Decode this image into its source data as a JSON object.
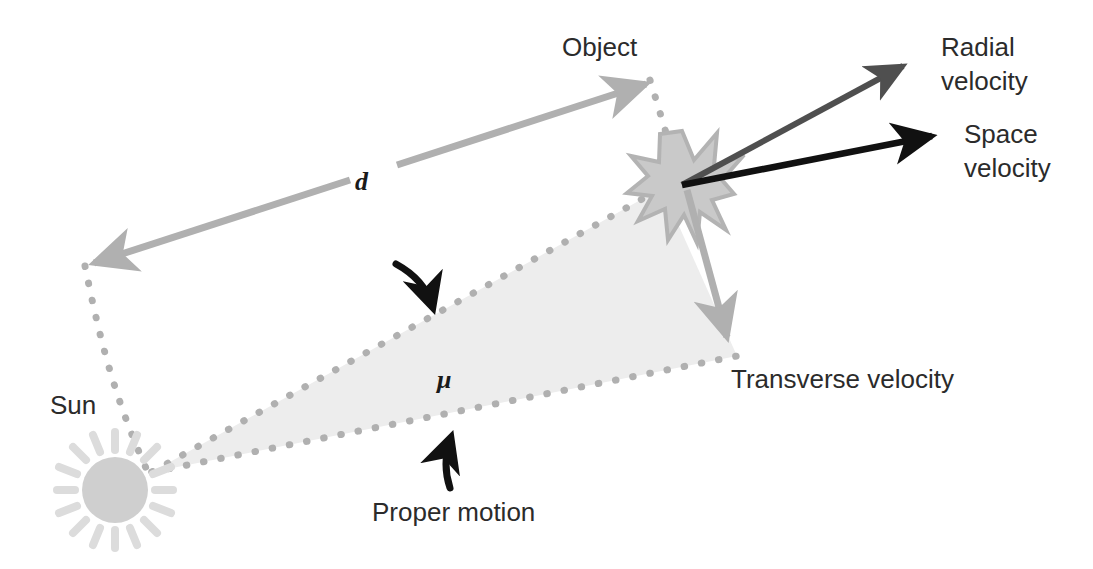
{
  "diagram": {
    "background_color": "#ffffff",
    "width": 1093,
    "height": 569
  },
  "palette": {
    "light_gray": "#bfbfbf",
    "mid_gray": "#a8a8a8",
    "dark_gray": "#555555",
    "black": "#111111",
    "text": "#2b2b2b",
    "fill_gray": "#eaeaea",
    "dot_gray": "#b0b0b0",
    "sun_body": "#cfcfcf",
    "sun_ray": "#dcdcdc",
    "star_fill": "#c9c9c9",
    "star_stroke": "#b3b3b3"
  },
  "labels": {
    "object": "Object",
    "sun": "Sun",
    "distance": "d",
    "mu": "μ",
    "radial_velocity_line1": "Radial",
    "radial_velocity_line2": "velocity",
    "space_velocity_line1": "Space",
    "space_velocity_line2": "velocity",
    "transverse_velocity": "Transverse velocity",
    "proper_motion": "Proper motion"
  },
  "elements": {
    "sun": {
      "cx": 115,
      "cy": 490,
      "r": 33,
      "ray_count": 16,
      "ray_inner": 40,
      "ray_outer": 58
    },
    "star": {
      "cx": 682,
      "cy": 185,
      "points": 11,
      "outer_r": 52,
      "inner_r": 19
    },
    "distance_arrow": {
      "x1": 88,
      "y1": 265,
      "x2": 652,
      "y2": 82,
      "color": "#b0b0b0",
      "double_headed": true
    },
    "radial_velocity_arrow": {
      "x1": 682,
      "y1": 185,
      "x2": 916,
      "y2": 58,
      "color": "#4f4f4f"
    },
    "space_velocity_arrow": {
      "x1": 682,
      "y1": 185,
      "x2": 944,
      "y2": 133,
      "color": "#111111"
    },
    "transverse_velocity_arrow": {
      "x1": 690,
      "y1": 195,
      "x2": 733,
      "y2": 352,
      "color": "#b0b0b0"
    },
    "proper_motion_wedge": {
      "apex_x": 152,
      "apex_y": 472,
      "upper_x": 660,
      "upper_y": 190,
      "lower_x": 735,
      "lower_y": 355,
      "fill": "#ededed"
    }
  },
  "annotations": {
    "mu_pointer": "curved-arrow pointing down-right to upper wedge edge",
    "proper_motion_pointer": "curved-arrow pointing up to lower wedge edge"
  }
}
